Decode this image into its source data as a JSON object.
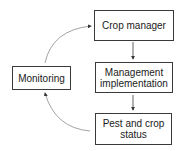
{
  "diagram": {
    "type": "cycle-flow",
    "nodes": [
      {
        "id": "crop-manager",
        "label": "Crop manager"
      },
      {
        "id": "management-implementation",
        "label": "Management implementation"
      },
      {
        "id": "pest-crop-status",
        "label": "Pest and crop status"
      },
      {
        "id": "monitoring",
        "label": "Monitoring"
      }
    ],
    "edges": [
      {
        "from": "crop-manager",
        "to": "management-implementation"
      },
      {
        "from": "management-implementation",
        "to": "pest-crop-status"
      },
      {
        "from": "pest-crop-status",
        "to": "monitoring"
      },
      {
        "from": "monitoring",
        "to": "crop-manager"
      }
    ]
  },
  "labels": {
    "crop_manager": "Crop manager",
    "management_line1": "Management",
    "management_line2": "implementation",
    "pest_line1": "Pest and crop",
    "pest_line2": "status",
    "monitoring": "Monitoring"
  },
  "colors": {
    "box_border": "#3a3a3a",
    "arrow_curve": "#8a8a8a",
    "arrow_straight": "#3a3a3a"
  }
}
